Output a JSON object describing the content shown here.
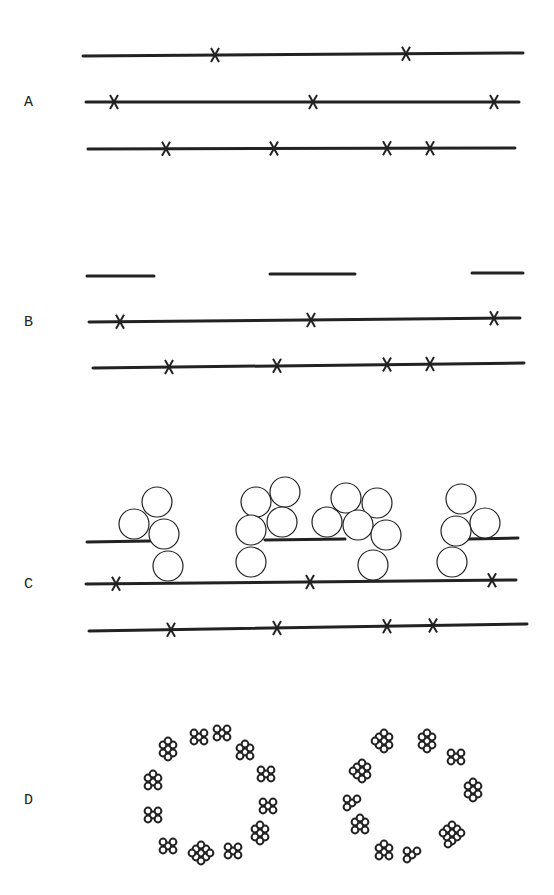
{
  "colors": {
    "ink": "#222222",
    "background": "#ffffff"
  },
  "panels": [
    {
      "id": "A",
      "label": "A",
      "label_pos": [
        28,
        108
      ],
      "lines": [
        {
          "x1": 83,
          "y1": 56,
          "x2": 523,
          "y2": 53,
          "marks": [
            215,
            406
          ]
        },
        {
          "x1": 86,
          "y1": 102,
          "x2": 519,
          "y2": 102,
          "marks": [
            114,
            313,
            494
          ]
        },
        {
          "x1": 88,
          "y1": 149,
          "x2": 515,
          "y2": 148,
          "marks": [
            166,
            274,
            387,
            430
          ]
        }
      ]
    },
    {
      "id": "B",
      "label": "B",
      "label_pos": [
        28,
        328
      ],
      "segments": [
        {
          "x1": 87,
          "y1": 276,
          "x2": 154,
          "y2": 276
        },
        {
          "x1": 270,
          "y1": 274,
          "x2": 355,
          "y2": 274
        },
        {
          "x1": 472,
          "y1": 273,
          "x2": 523,
          "y2": 273
        }
      ],
      "lines": [
        {
          "x1": 89,
          "y1": 322,
          "x2": 520,
          "y2": 318,
          "marks": [
            120,
            311,
            494
          ]
        },
        {
          "x1": 93,
          "y1": 368,
          "x2": 524,
          "y2": 363,
          "marks": [
            169,
            277,
            387,
            430
          ]
        }
      ]
    },
    {
      "id": "C",
      "label": "C",
      "label_pos": [
        28,
        590
      ],
      "segments": [
        {
          "x1": 87,
          "y1": 542,
          "x2": 150,
          "y2": 541
        },
        {
          "x1": 265,
          "y1": 540,
          "x2": 345,
          "y2": 539
        },
        {
          "x1": 468,
          "y1": 539,
          "x2": 518,
          "y2": 538
        }
      ],
      "lines": [
        {
          "x1": 86,
          "y1": 584,
          "x2": 516,
          "y2": 580,
          "marks": [
            116,
            310,
            492
          ]
        },
        {
          "x1": 89,
          "y1": 631,
          "x2": 527,
          "y2": 624,
          "marks": [
            171,
            277,
            387,
            433
          ]
        }
      ],
      "circle_radius": 15,
      "circles": [
        [
          157,
          502
        ],
        [
          134,
          524
        ],
        [
          164,
          534
        ],
        [
          168,
          566
        ],
        [
          256,
          502
        ],
        [
          285,
          492
        ],
        [
          282,
          522
        ],
        [
          251,
          530
        ],
        [
          251,
          562
        ],
        [
          346,
          498
        ],
        [
          377,
          503
        ],
        [
          327,
          522
        ],
        [
          358,
          525
        ],
        [
          386,
          535
        ],
        [
          373,
          565
        ],
        [
          461,
          499
        ],
        [
          485,
          523
        ],
        [
          456,
          531
        ],
        [
          452,
          562
        ]
      ]
    },
    {
      "id": "D",
      "label": "D",
      "label_pos": [
        28,
        806
      ],
      "rings": [
        {
          "cx": 212,
          "cy": 795,
          "clusters": [
            {
              "x": 168,
              "y": 749,
              "n": 7
            },
            {
              "x": 199,
              "y": 737,
              "n": 5
            },
            {
              "x": 222,
              "y": 733,
              "n": 5
            },
            {
              "x": 245,
              "y": 752,
              "n": 6
            },
            {
              "x": 266,
              "y": 774,
              "n": 5
            },
            {
              "x": 268,
              "y": 806,
              "n": 5
            },
            {
              "x": 260,
              "y": 833,
              "n": 7
            },
            {
              "x": 233,
              "y": 851,
              "n": 5
            },
            {
              "x": 201,
              "y": 853,
              "n": 9
            },
            {
              "x": 168,
              "y": 846,
              "n": 5
            },
            {
              "x": 153,
              "y": 815,
              "n": 5
            },
            {
              "x": 153,
              "y": 782,
              "n": 6
            }
          ]
        },
        {
          "cx": 410,
          "cy": 795,
          "clusters": [
            {
              "x": 384,
              "y": 741,
              "n": 8
            },
            {
              "x": 427,
              "y": 741,
              "n": 7
            },
            {
              "x": 456,
              "y": 757,
              "n": 5
            },
            {
              "x": 473,
              "y": 790,
              "n": 7
            },
            {
              "x": 452,
              "y": 833,
              "n": 10
            },
            {
              "x": 412,
              "y": 855,
              "n": 4
            },
            {
              "x": 384,
              "y": 852,
              "n": 6
            },
            {
              "x": 360,
              "y": 826,
              "n": 6
            },
            {
              "x": 352,
              "y": 803,
              "n": 4
            },
            {
              "x": 362,
              "y": 771,
              "n": 8
            }
          ]
        }
      ]
    }
  ]
}
